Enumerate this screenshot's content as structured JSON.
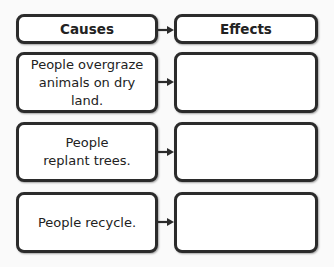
{
  "headers": {
    "causes": "Causes",
    "effects": "Effects"
  },
  "rows": [
    {
      "cause": "People overgraze animals on dry land.",
      "effect": ""
    },
    {
      "cause": "People replant trees.",
      "effect": ""
    },
    {
      "cause": "People recycle.",
      "effect": ""
    }
  ],
  "colors": {
    "border": "#2b2b2b",
    "background": "#fafafa",
    "box": "#ffffff"
  }
}
